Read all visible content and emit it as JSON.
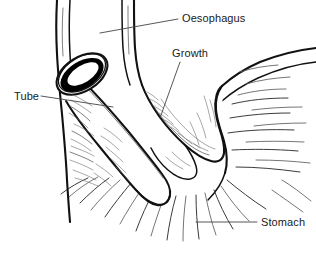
{
  "figure": {
    "background_color": "#ffffff",
    "line_color": "#111111",
    "label_color": "#1a1a1a",
    "leader_color": "#444444",
    "width": 316,
    "height": 274
  },
  "labels": {
    "oesophagus": {
      "text": "Oesophagus",
      "x": 182,
      "y": 22
    },
    "growth": {
      "text": "Growth",
      "x": 172,
      "y": 57
    },
    "tube": {
      "text": "Tube",
      "x": 14,
      "y": 100
    },
    "stomach": {
      "text": "Stomach",
      "x": 261,
      "y": 226
    }
  },
  "leaders": {
    "oesophagus": "M 178 19 L 100 33",
    "growth": "M 180 62 L 160 118",
    "tube": "M 41 96 L 113 107",
    "stomach": "M 257 222 L 196 222"
  },
  "anatomy": {
    "parts": [
      "oesophagus-wall-left",
      "oesophagus-wall-right",
      "growth-mass",
      "stomach-wall",
      "intubation-tube",
      "tube-lumen"
    ]
  }
}
